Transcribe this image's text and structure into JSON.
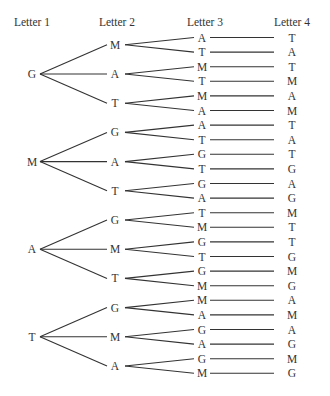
{
  "headers": [
    "Letter 1",
    "Letter 2",
    "Letter 3",
    "Letter 4"
  ],
  "tree": [
    {
      "letter": "G",
      "children": [
        {
          "letter": "M",
          "children": [
            {
              "l3": "A",
              "l4": "T"
            },
            {
              "l3": "T",
              "l4": "A"
            }
          ]
        },
        {
          "letter": "A",
          "children": [
            {
              "l3": "M",
              "l4": "T"
            },
            {
              "l3": "T",
              "l4": "M"
            }
          ]
        },
        {
          "letter": "T",
          "children": [
            {
              "l3": "M",
              "l4": "A"
            },
            {
              "l3": "A",
              "l4": "M"
            }
          ]
        }
      ]
    },
    {
      "letter": "M",
      "children": [
        {
          "letter": "G",
          "children": [
            {
              "l3": "A",
              "l4": "T"
            },
            {
              "l3": "T",
              "l4": "A"
            }
          ]
        },
        {
          "letter": "A",
          "children": [
            {
              "l3": "G",
              "l4": "T"
            },
            {
              "l3": "T",
              "l4": "G"
            }
          ]
        },
        {
          "letter": "T",
          "children": [
            {
              "l3": "G",
              "l4": "A"
            },
            {
              "l3": "A",
              "l4": "G"
            }
          ]
        }
      ]
    },
    {
      "letter": "A",
      "children": [
        {
          "letter": "G",
          "children": [
            {
              "l3": "T",
              "l4": "M"
            },
            {
              "l3": "M",
              "l4": "T"
            }
          ]
        },
        {
          "letter": "M",
          "children": [
            {
              "l3": "G",
              "l4": "T"
            },
            {
              "l3": "T",
              "l4": "G"
            }
          ]
        },
        {
          "letter": "T",
          "children": [
            {
              "l3": "G",
              "l4": "M"
            },
            {
              "l3": "M",
              "l4": "G"
            }
          ]
        }
      ]
    },
    {
      "letter": "T",
      "children": [
        {
          "letter": "G",
          "children": [
            {
              "l3": "M",
              "l4": "A"
            },
            {
              "l3": "A",
              "l4": "M"
            }
          ]
        },
        {
          "letter": "M",
          "children": [
            {
              "l3": "G",
              "l4": "A"
            },
            {
              "l3": "A",
              "l4": "G"
            }
          ]
        },
        {
          "letter": "A",
          "children": [
            {
              "l3": "G",
              "l4": "M"
            },
            {
              "l3": "M",
              "l4": "G"
            }
          ]
        }
      ]
    }
  ]
}
